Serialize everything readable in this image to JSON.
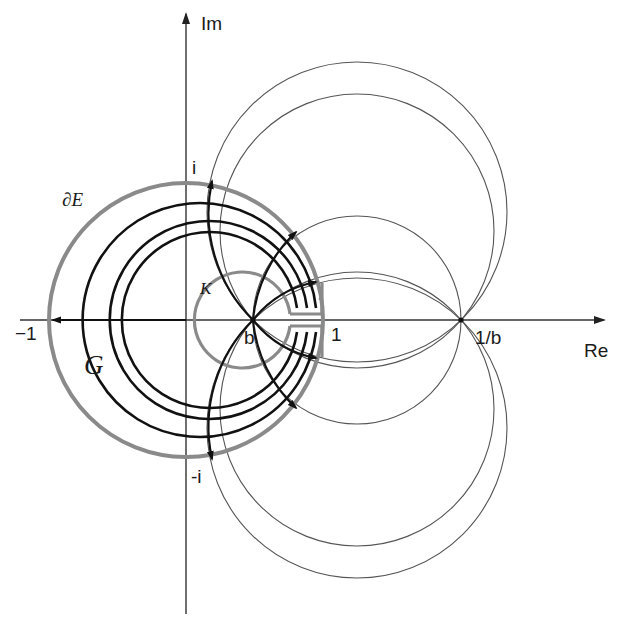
{
  "figure": {
    "colors": {
      "background": "#ffffff",
      "axis": "#333333",
      "thin_circle": "#555555",
      "boundary_gray": "#8a8a8a",
      "bold_curve": "#111111"
    }
  },
  "axes": {
    "x_label": "Re",
    "y_label": "Im",
    "origin_px": [
      186,
      320
    ]
  },
  "tick_labels": {
    "minus_one": "−1",
    "one": "1",
    "b": "b",
    "inv_b": "1/b",
    "i": "i",
    "minus_i": "-i"
  },
  "region_labels": {
    "boundary_E": "∂E",
    "set_K": "K",
    "domain_G": "G"
  },
  "geometry": {
    "unit_circle": {
      "cx": 186,
      "cy": 320,
      "r": 137
    },
    "point_b": {
      "x": 253,
      "y": 320
    },
    "point_one": {
      "x": 323,
      "y": 320
    },
    "point_inv_b": {
      "x": 461,
      "y": 320
    },
    "thin_circles": [
      {
        "name": "upper-large",
        "cx": 357,
        "cy": 212,
        "r": 150
      },
      {
        "name": "middle",
        "cx": 357,
        "cy": 320,
        "r": 104
      },
      {
        "name": "upper-lens",
        "cx": 357,
        "cy": 409,
        "r": 137
      },
      {
        "name": "lower-lens",
        "cx": 357,
        "cy": 231,
        "r": 137
      },
      {
        "name": "lower-large",
        "cx": 357,
        "cy": 428,
        "r": 150
      }
    ],
    "bold_level_arcs_r": [
      133,
      91,
      48
    ]
  }
}
